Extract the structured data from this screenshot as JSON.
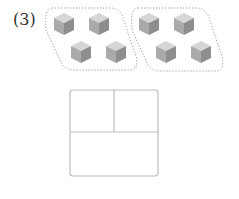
{
  "problem": {
    "number_label": "(3)",
    "groups": [
      {
        "name": "group-1",
        "cube_count": 4
      },
      {
        "name": "group-2",
        "cube_count": 4
      }
    ],
    "answer_box": {
      "cells": [
        "",
        "",
        ""
      ]
    }
  },
  "colors": {
    "cube_top": "#d4d4d4",
    "cube_left": "#a9a9a9",
    "cube_right": "#8f8f8f",
    "dotted_outline": "#999999",
    "box_border": "#bdbdbd"
  }
}
